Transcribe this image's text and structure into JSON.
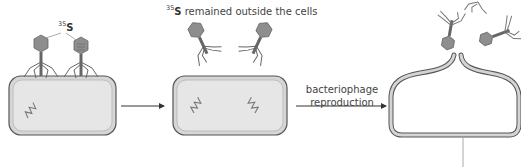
{
  "diagram": {
    "title": "",
    "panels": [
      {
        "id": "infection",
        "label": {
          "isotope_mass": "35",
          "element": "S"
        },
        "description": "Two bacteriophages with 35S-labelled protein coats attached to bacterial cell"
      },
      {
        "id": "after-separation",
        "label": {
          "isotope_mass": "35",
          "element": "S",
          "text": "remained outside the cells"
        },
        "description": "Phage coats detached and remain outside; cell contains phage DNA"
      },
      {
        "id": "lysis",
        "description": "Cell bursts releasing new bacteriophages"
      }
    ],
    "arrows": [
      {
        "id": "arrow-1",
        "label": ""
      },
      {
        "id": "arrow-2",
        "label_line1": "bacteriophage",
        "label_line2": "reproduction"
      }
    ],
    "colors": {
      "cell_wall": "#8a8a8a",
      "cell_fill": "#e3e3e3",
      "cell_inner": "#ececec",
      "phage_head": "#8c8c8c",
      "text": "#444444"
    }
  }
}
